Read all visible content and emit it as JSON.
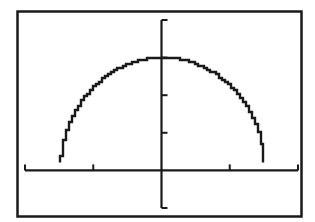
{
  "chart_data": {
    "type": "line",
    "title": "",
    "xlabel": "",
    "ylabel": "",
    "window": {
      "xmin": -2,
      "xmax": 2,
      "xscl": 1,
      "ymin": -1,
      "ymax": 4,
      "yscl": 1
    },
    "grid": false,
    "legend": null,
    "series": [
      {
        "name": "Y1",
        "equation": "y = sqrt(9 - 4x^2)",
        "x": [
          -1.5,
          -1.4,
          -1.2,
          -1.0,
          -0.8,
          -0.6,
          -0.4,
          -0.2,
          0,
          0.2,
          0.4,
          0.6,
          0.8,
          1.0,
          1.2,
          1.4,
          1.5
        ],
        "values": [
          0.0,
          1.08,
          1.8,
          2.24,
          2.54,
          2.75,
          2.89,
          2.97,
          3.0,
          2.97,
          2.89,
          2.75,
          2.54,
          2.24,
          1.8,
          1.08,
          0.0
        ]
      }
    ],
    "x_ticks": [
      -2,
      -1,
      0,
      1,
      2
    ],
    "y_ticks": [
      -1,
      0,
      1,
      2,
      3,
      4
    ]
  },
  "colors": {
    "background": "#ffffff",
    "ink": "#1a1a1a"
  }
}
